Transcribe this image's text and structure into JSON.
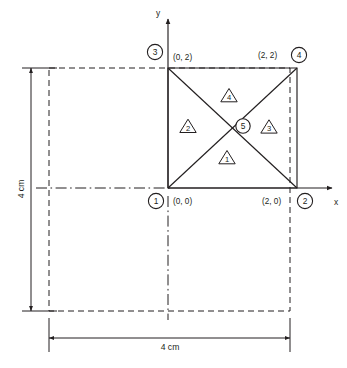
{
  "axes": {
    "x_label": "x",
    "y_label": "y",
    "origin_label": "(0, 0)"
  },
  "nodes": [
    {
      "id": "1",
      "coord_label": "(0, 0)",
      "x": 0,
      "y": 0
    },
    {
      "id": "2",
      "coord_label": "(2, 0)",
      "x": 2,
      "y": 0
    },
    {
      "id": "3",
      "coord_label": "(0, 2)",
      "x": 0,
      "y": 2
    },
    {
      "id": "4",
      "coord_label": "(2, 2)",
      "x": 2,
      "y": 2
    },
    {
      "id": "5",
      "coord_label": "",
      "x": 1,
      "y": 1
    }
  ],
  "elements": [
    {
      "id": "1",
      "shape": "triangle",
      "nodes": "1-2-5"
    },
    {
      "id": "2",
      "shape": "triangle",
      "nodes": "1-5-3"
    },
    {
      "id": "3",
      "shape": "triangle",
      "nodes": "2-4-5"
    },
    {
      "id": "4",
      "shape": "triangle",
      "nodes": "5-4-3"
    }
  ],
  "dimensions": {
    "vertical": {
      "label": "4 cm",
      "orientation": "vertical"
    },
    "horizontal": {
      "label": "4 cm",
      "orientation": "horizontal"
    }
  },
  "colors": {
    "ink": "#231f20",
    "background": "#ffffff"
  }
}
